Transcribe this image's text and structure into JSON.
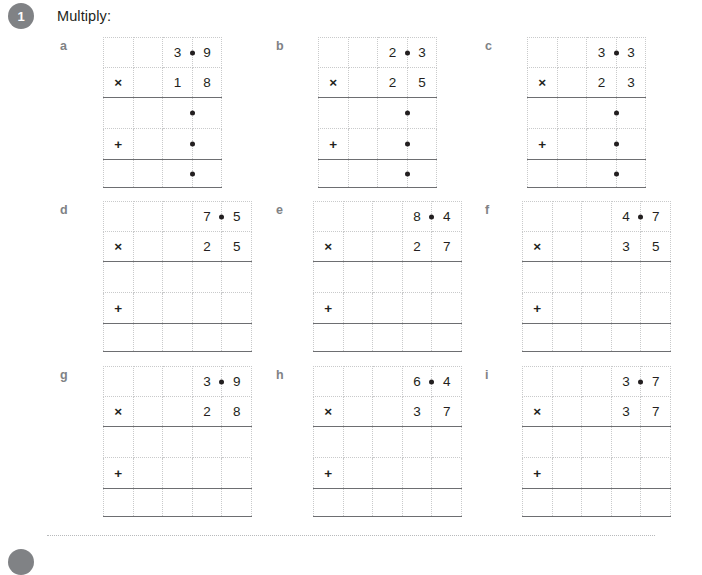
{
  "question": {
    "number": "1",
    "prompt": "Multiply:"
  },
  "columns_row1": 4,
  "columns_row2": 5,
  "colors": {
    "badge": "#808285",
    "label": "#808285",
    "gridline": "#c9cacb",
    "rule": "#6d6e71",
    "text": "#231f20"
  },
  "operators": {
    "multiply": "×",
    "add": "+"
  },
  "problems": [
    {
      "label": "a",
      "cols": 4,
      "multiplicand": {
        "whole": "3",
        "decimal": "9"
      },
      "multiplier": {
        "tens": "1",
        "ones": "8"
      },
      "partial_dots": true,
      "answer_dot": true
    },
    {
      "label": "b",
      "cols": 4,
      "multiplicand": {
        "whole": "2",
        "decimal": "3"
      },
      "multiplier": {
        "tens": "2",
        "ones": "5"
      },
      "partial_dots": true,
      "answer_dot": true
    },
    {
      "label": "c",
      "cols": 4,
      "multiplicand": {
        "whole": "3",
        "decimal": "3"
      },
      "multiplier": {
        "tens": "2",
        "ones": "3"
      },
      "partial_dots": true,
      "answer_dot": true
    },
    {
      "label": "d",
      "cols": 5,
      "multiplicand": {
        "whole": "7",
        "decimal": "5"
      },
      "multiplier": {
        "tens": "2",
        "ones": "5"
      },
      "partial_dots": false,
      "answer_dot": false
    },
    {
      "label": "e",
      "cols": 5,
      "multiplicand": {
        "whole": "8",
        "decimal": "4"
      },
      "multiplier": {
        "tens": "2",
        "ones": "7"
      },
      "partial_dots": false,
      "answer_dot": false
    },
    {
      "label": "f",
      "cols": 5,
      "multiplicand": {
        "whole": "4",
        "decimal": "7"
      },
      "multiplier": {
        "tens": "3",
        "ones": "5"
      },
      "partial_dots": false,
      "answer_dot": false
    },
    {
      "label": "g",
      "cols": 5,
      "multiplicand": {
        "whole": "3",
        "decimal": "9"
      },
      "multiplier": {
        "tens": "2",
        "ones": "8"
      },
      "partial_dots": false,
      "answer_dot": false
    },
    {
      "label": "h",
      "cols": 5,
      "multiplicand": {
        "whole": "6",
        "decimal": "4"
      },
      "multiplier": {
        "tens": "3",
        "ones": "7"
      },
      "partial_dots": false,
      "answer_dot": false
    },
    {
      "label": "i",
      "cols": 5,
      "multiplicand": {
        "whole": "3",
        "decimal": "7"
      },
      "multiplier": {
        "tens": "3",
        "ones": "7"
      },
      "partial_dots": false,
      "answer_dot": false
    }
  ],
  "next_question": {
    "number": ""
  }
}
